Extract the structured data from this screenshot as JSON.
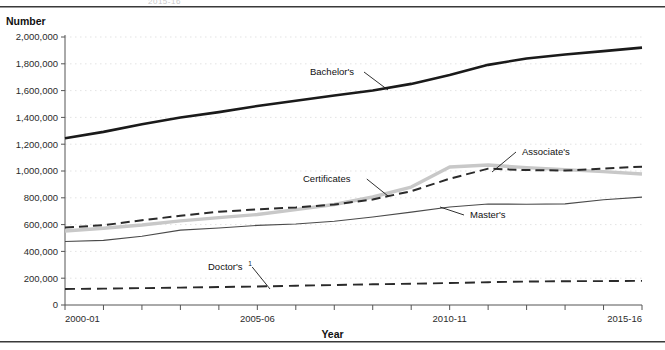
{
  "page": {
    "ghost_header": "2015-16",
    "y_axis_title": "Number",
    "x_axis_title": "Year"
  },
  "chart_data": {
    "type": "line",
    "title": "",
    "xlabel": "Year",
    "ylabel": "Number",
    "x": [
      "2000-01",
      "2001-02",
      "2002-03",
      "2003-04",
      "2004-05",
      "2005-06",
      "2006-07",
      "2007-08",
      "2008-09",
      "2009-10",
      "2010-11",
      "2011-12",
      "2012-13",
      "2013-14",
      "2014-15",
      "2015-16"
    ],
    "x_tick_labels": [
      "2000-01",
      "2005-06",
      "2010-11",
      "2015-16"
    ],
    "x_tick_label_indices": [
      0,
      5,
      10,
      15
    ],
    "ylim": [
      0,
      2000000
    ],
    "y_ticks": [
      0,
      200000,
      400000,
      600000,
      800000,
      1000000,
      1200000,
      1400000,
      1600000,
      1800000,
      2000000
    ],
    "y_tick_labels": [
      "0",
      "200,000",
      "400,000",
      "600,000",
      "800,000",
      "1,000,000",
      "1,200,000",
      "1,400,000",
      "1,600,000",
      "1,800,000",
      "2,000,000"
    ],
    "grid": true,
    "legend": "inline-labels",
    "series": [
      {
        "name": "Bachelor's",
        "label": "Bachelor's",
        "style": "solid-thick-dark",
        "color": "#1a1a1a",
        "values": [
          1244171,
          1291900,
          1348503,
          1399542,
          1439264,
          1485242,
          1524092,
          1563069,
          1601368,
          1650014,
          1715913,
          1792163,
          1840164,
          1869814,
          1894934,
          1920718
        ]
      },
      {
        "name": "Certificates",
        "label": "Certificates",
        "style": "solid-thick-light",
        "color": "#c8c8c8",
        "values": [
          552503,
          573000,
          597000,
          628000,
          652000,
          675000,
          712000,
          750000,
          806000,
          880000,
          1030000,
          1045000,
          1025000,
          1010000,
          995000,
          978000
        ]
      },
      {
        "name": "Associate's",
        "label": "Associate's",
        "style": "dashed-dark",
        "color": "#2a2a2a",
        "values": [
          578865,
          595133,
          632912,
          665301,
          696660,
          713066,
          728114,
          750164,
          787325,
          849452,
          942327,
          1017538,
          1006961,
          1003364,
          1018181,
          1032245
        ]
      },
      {
        "name": "Master's",
        "label": "Master's",
        "style": "solid-thin-dark",
        "color": "#4a4a4a",
        "values": [
          473502,
          482118,
          512645,
          558940,
          574618,
          594065,
          604607,
          625023,
          656212,
          693025,
          730922,
          754229,
          751751,
          754475,
          785595,
          805000
        ]
      },
      {
        "name": "Doctor's",
        "label": "Doctor's",
        "label_superscript": "1",
        "style": "dashed-long-dark",
        "color": "#2a2a2a",
        "values": [
          119585,
          122000,
          126000,
          130000,
          134000,
          138000,
          144000,
          149000,
          154500,
          158600,
          164000,
          170000,
          175000,
          177600,
          178500,
          180000
        ]
      }
    ],
    "annotations": [
      {
        "text": "Bachelor's",
        "x_px": 310,
        "y_px": 75,
        "leader_to_x": 388,
        "leader_to_y": 90
      },
      {
        "text": "Certificates",
        "x_px": 303,
        "y_px": 182,
        "leader_to_x": 388,
        "leader_to_y": 196
      },
      {
        "text": "Associate's",
        "x_px": 522,
        "y_px": 155,
        "leader_to_x": 492,
        "leader_to_y": 172
      },
      {
        "text": "Master's",
        "x_px": 470,
        "y_px": 218,
        "leader_to_x": 440,
        "leader_to_y": 207
      },
      {
        "text": "Doctor's",
        "x_px": 208,
        "y_px": 270,
        "leader_to_x": 270,
        "leader_to_y": 289
      }
    ]
  }
}
